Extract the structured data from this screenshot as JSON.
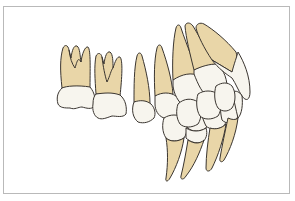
{
  "figure": {
    "colors": {
      "root": "#e9d6a8",
      "crown": "#f7f5ee",
      "outline": "#3a3530",
      "frame_border": "#b9b9b9",
      "background": "#ffffff"
    },
    "upper_teeth": [
      {
        "name": "molar-1"
      },
      {
        "name": "molar-2"
      },
      {
        "name": "premolar-1"
      },
      {
        "name": "premolar-2"
      },
      {
        "name": "canine"
      },
      {
        "name": "incisor-lateral"
      },
      {
        "name": "incisor-central"
      }
    ],
    "lower_teeth": [
      {
        "name": "premolar"
      },
      {
        "name": "canine"
      },
      {
        "name": "incisor-lateral"
      },
      {
        "name": "incisor-central"
      }
    ]
  }
}
